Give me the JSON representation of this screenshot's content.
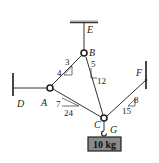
{
  "diagram": {
    "type": "statics cable system",
    "points": {
      "A": {
        "label": "A"
      },
      "B": {
        "label": "B"
      },
      "C": {
        "label": "C"
      },
      "D": {
        "label": "D"
      },
      "E": {
        "label": "E"
      },
      "F": {
        "label": "F"
      },
      "G": {
        "label": "G"
      }
    },
    "slopes": {
      "AB": {
        "rise": "4",
        "run": "3"
      },
      "BC": {
        "run": "5",
        "rise": "12"
      },
      "AC": {
        "rise": "7",
        "run": "24"
      },
      "CF": {
        "rise": "8",
        "run": "15"
      }
    },
    "mass": {
      "label": "10 kg"
    },
    "colors": {
      "line": "#333333",
      "box_fill": "#8a8a8a",
      "box_border": "#222222"
    }
  }
}
